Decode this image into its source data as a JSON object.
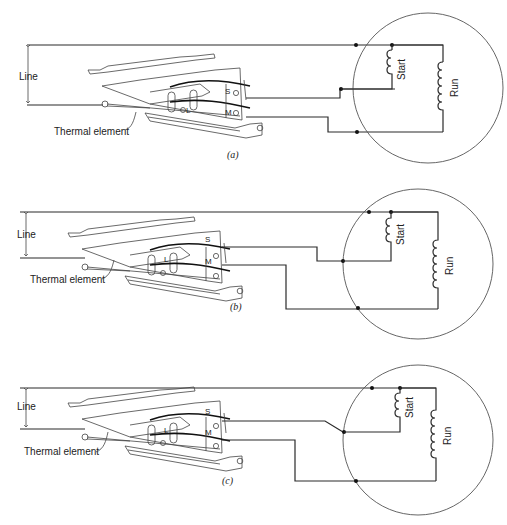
{
  "figure": {
    "panels": [
      {
        "id": "a",
        "caption": "(a)",
        "line_label": "Line",
        "thermal_label": "Thermal element",
        "terminal_labels": {
          "start": "S",
          "main": "M",
          "line": "L"
        },
        "winding_labels": {
          "start": "Start",
          "run": "Run"
        }
      },
      {
        "id": "b",
        "caption": "(b)",
        "line_label": "Line",
        "thermal_label": "Thermal element",
        "terminal_labels": {
          "start": "S",
          "main": "M",
          "line": "L"
        },
        "winding_labels": {
          "start": "Start",
          "run": "Run"
        }
      },
      {
        "id": "c",
        "caption": "(c)",
        "line_label": "Line",
        "thermal_label": "Thermal element",
        "terminal_labels": {
          "start": "S",
          "main": "M",
          "line": "L"
        },
        "winding_labels": {
          "start": "Start",
          "run": "Run"
        }
      }
    ]
  }
}
